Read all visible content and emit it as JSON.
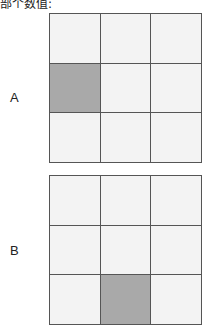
{
  "caption": "部个数值:",
  "figures": [
    {
      "label": "A",
      "shaded_cell": {
        "row": 1,
        "col": 0
      }
    },
    {
      "label": "B",
      "shaded_cell": {
        "row": 2,
        "col": 1
      }
    }
  ],
  "colors": {
    "cell": "#f3f3f3",
    "shaded": "#a9a9a9",
    "line": "#555555"
  }
}
